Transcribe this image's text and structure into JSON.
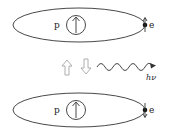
{
  "diagram": {
    "top_atom": {
      "proton_label": "p",
      "electron_label": "e",
      "proton_spin": "up",
      "electron_spin": "up"
    },
    "bottom_atom": {
      "proton_label": "p",
      "electron_label": "e",
      "proton_spin": "up",
      "electron_spin": "down"
    },
    "transition": {
      "up_arrow": "hollow-up-arrow",
      "down_arrow": "hollow-down-arrow",
      "photon_label": "hν"
    },
    "colors": {
      "line": "#333333",
      "hollow_arrow": "#999999"
    }
  }
}
